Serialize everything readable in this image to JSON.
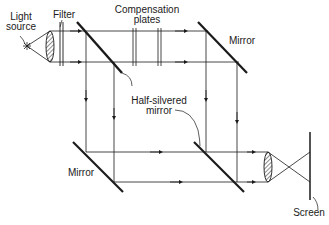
{
  "diagram": {
    "labels": {
      "light_source_line1": "Light",
      "light_source_line2": "source",
      "filter": "Filter",
      "compensation_line1": "Compensation",
      "compensation_line2": "plates",
      "mirror_top": "Mirror",
      "half_silvered_line1": "Half-silvered",
      "half_silvered_line2": "mirror",
      "mirror_bottom": "Mirror",
      "screen": "Screen"
    },
    "colors": {
      "ink": "#1a1a1a",
      "background": "#ffffff"
    }
  }
}
